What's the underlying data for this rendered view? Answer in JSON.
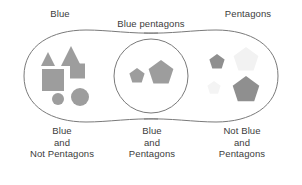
{
  "diagram": {
    "title_labels": {
      "left": "Blue",
      "middle": "Blue pentagons",
      "right": "Pentagons"
    },
    "captions": {
      "left": {
        "line1": "Blue",
        "line2": "and",
        "line3": "Not Pentagons"
      },
      "middle": {
        "line1": "Blue",
        "line2": "and",
        "line3": "Pentagons"
      },
      "right": {
        "line1": "Not Blue",
        "line2": "and",
        "line3": "Pentagons"
      }
    },
    "colors": {
      "outline": "#7a7a7a",
      "shape_gray": "#9d9d9d",
      "shape_faint": "#f0f0f0",
      "text": "#3c3c3c",
      "background": "#ffffff"
    },
    "regions": {
      "left_lobe": {
        "name": "Blue and Not Pentagons",
        "shapes": [
          {
            "kind": "triangle",
            "size": "small",
            "fill": "#9d9d9d",
            "cx": 48,
            "cy": 59,
            "r": 7
          },
          {
            "kind": "triangle",
            "size": "large",
            "fill": "#9d9d9d",
            "cx": 71,
            "cy": 56,
            "r": 10
          },
          {
            "kind": "square",
            "size": "large",
            "fill": "#9d9d9d",
            "cx": 53,
            "cy": 80,
            "r": 11
          },
          {
            "kind": "square",
            "size": "small",
            "fill": "#9d9d9d",
            "cx": 77,
            "cy": 71,
            "r": 7.5
          },
          {
            "kind": "circle",
            "size": "small",
            "fill": "#9d9d9d",
            "cx": 58,
            "cy": 99,
            "r": 6
          },
          {
            "kind": "circle",
            "size": "large",
            "fill": "#9d9d9d",
            "cx": 80,
            "cy": 97,
            "r": 9
          }
        ]
      },
      "middle_circle": {
        "name": "Blue and Pentagons",
        "shapes": [
          {
            "kind": "pentagon",
            "size": "small",
            "fill": "#9d9d9d",
            "cx": 137,
            "cy": 76,
            "r": 8
          },
          {
            "kind": "pentagon",
            "size": "large",
            "fill": "#9d9d9d",
            "cx": 161,
            "cy": 73,
            "r": 13
          }
        ]
      },
      "right_lobe": {
        "name": "Not Blue and Pentagons",
        "shapes": [
          {
            "kind": "pentagon",
            "size": "small",
            "fill": "#8f8f8f",
            "cx": 217,
            "cy": 62,
            "r": 8
          },
          {
            "kind": "pentagon",
            "size": "large",
            "fill": "#f2f2f2",
            "cx": 246,
            "cy": 60,
            "r": 13
          },
          {
            "kind": "pentagon",
            "size": "small",
            "fill": "#f4f4f4",
            "cx": 214,
            "cy": 88,
            "r": 7
          },
          {
            "kind": "pentagon",
            "size": "large",
            "fill": "#8f8f8f",
            "cx": 246,
            "cy": 90,
            "r": 14
          }
        ]
      }
    }
  }
}
